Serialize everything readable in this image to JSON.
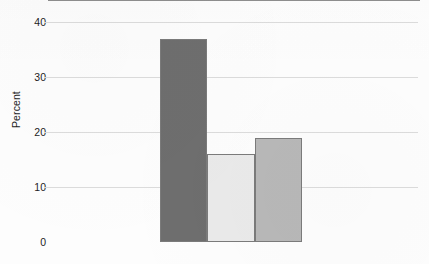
{
  "chart_data": {
    "type": "bar",
    "title": "",
    "subtitle": "",
    "xlabel": "",
    "ylabel": "Percent",
    "categories": [
      "",
      "",
      ""
    ],
    "values": [
      37,
      16,
      19
    ],
    "series": [
      {
        "name": "Percent",
        "values": [
          37,
          16,
          19
        ]
      }
    ],
    "ylim": [
      0,
      40
    ],
    "yticks": [
      0,
      10,
      20,
      30,
      40
    ],
    "ytick_labels": [
      "0",
      "10",
      "20",
      "30",
      "40"
    ],
    "xticks": [],
    "xtick_labels": [],
    "grid": true,
    "grid_axis": "y",
    "legend": false,
    "legend_position": "none",
    "annotations": [],
    "bar_colors": [
      "#6e6e6e",
      "#eaeaea",
      "#b8b8b8"
    ],
    "bar_edge_color": "#7b7b7b",
    "grid_color": "#dcdcdc",
    "axis_color": "#8e8e8e",
    "text_color": "#1d1d1d",
    "background": "#fdfdfd"
  }
}
